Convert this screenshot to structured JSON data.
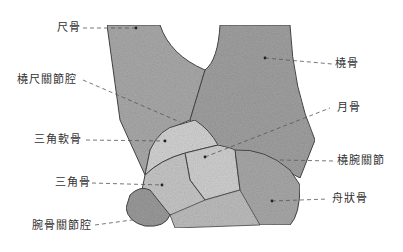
{
  "figure": {
    "colors": {
      "bone_fill": "#b8b8b8",
      "bone_dark": "#8a8a8a",
      "outline": "#444444",
      "leader": "#555555"
    },
    "labels": {
      "ulna": "尺骨",
      "radioulnar_joint_cavity": "橈尺關節腔",
      "triangular_cartilage": "三角軟骨",
      "triquetrum": "三角骨",
      "carpal_joint_cavity": "腕骨關節腔",
      "radius": "橈骨",
      "lunate": "月骨",
      "radiocarpal_joint": "橈腕關節",
      "scaphoid": "舟狀骨"
    }
  }
}
